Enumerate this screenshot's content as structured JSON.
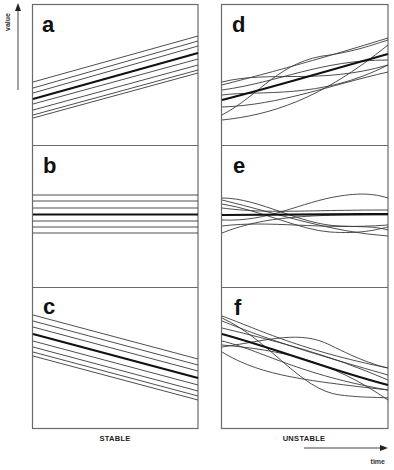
{
  "figure": {
    "axes": {
      "y_label": "value",
      "x_label": "time"
    },
    "columns": [
      {
        "label": "STABLE"
      },
      {
        "label": "UNSTABLE"
      }
    ],
    "panels": [
      {
        "id": "a",
        "letter": "a",
        "column": "STABLE",
        "trend": "increasing",
        "behavior": "parallel lines"
      },
      {
        "id": "b",
        "letter": "b",
        "column": "STABLE",
        "trend": "constant",
        "behavior": "parallel lines"
      },
      {
        "id": "c",
        "letter": "c",
        "column": "STABLE",
        "trend": "decreasing",
        "behavior": "parallel lines"
      },
      {
        "id": "d",
        "letter": "d",
        "column": "UNSTABLE",
        "trend": "increasing",
        "behavior": "crossing curves"
      },
      {
        "id": "e",
        "letter": "e",
        "column": "UNSTABLE",
        "trend": "constant",
        "behavior": "crossing curves"
      },
      {
        "id": "f",
        "letter": "f",
        "column": "UNSTABLE",
        "trend": "decreasing",
        "behavior": "crossing curves"
      }
    ],
    "colors": {
      "frame": "#6a6a6a",
      "line": "#3a3a3a",
      "mean_line": "#111111"
    }
  }
}
